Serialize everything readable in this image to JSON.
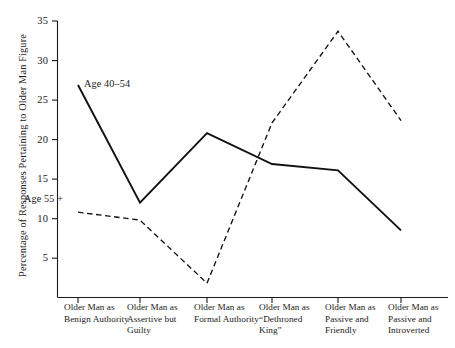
{
  "chart_data": {
    "type": "line",
    "title": "",
    "subtitle": "",
    "xlabel": "",
    "ylabel": "Percentage of Responses Pertaining to Older Man Figure",
    "categories": [
      "Older Man as Benign Authority",
      "Older Man as Assertive but Guilty",
      "Older Man as Formal Authority",
      "Older Man as “Dethroned King”",
      "Older Man as Passive and Friendly",
      "Older Man as Passive and Introverted"
    ],
    "series": [
      {
        "name": "Age 40–54",
        "style": "solid",
        "values": [
          26.9,
          12.0,
          20.8,
          16.9,
          16.1,
          8.5
        ]
      },
      {
        "name": "Age 55 +",
        "style": "dashed",
        "values": [
          10.8,
          9.8,
          1.8,
          22.1,
          33.7,
          22.4
        ]
      }
    ],
    "ylim": [
      0,
      35
    ],
    "yticks": [
      5,
      10,
      15,
      20,
      25,
      30,
      35
    ],
    "ytick_labels": [
      "5",
      "10",
      "15",
      "20",
      "25",
      "30",
      "35"
    ],
    "grid": false,
    "legend_position": "inline-annotations",
    "line_color": "#111111"
  },
  "axis": {
    "y_title": "Percentage of Responses Pertaining to Older Man Figure"
  },
  "xaxis": {
    "labels": [
      "Older Man as Benign Authority",
      "Older Man as Assertive but Guilty",
      "Older Man as Formal Authority",
      "Older Man as “Dethroned King”",
      "Older Man as Passive and Friendly",
      "Older Man as Passive and Introverted"
    ]
  },
  "annotations": {
    "series_one": "Age 40–54",
    "series_two": "Age 55 +"
  }
}
